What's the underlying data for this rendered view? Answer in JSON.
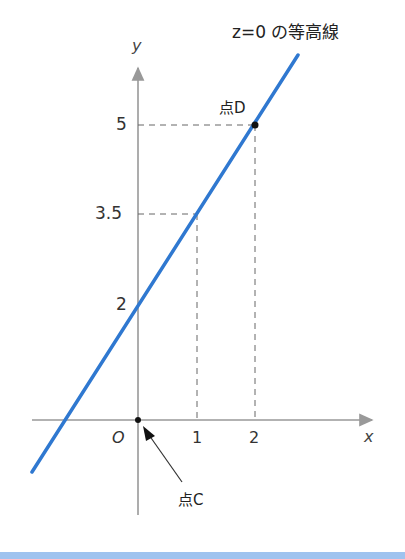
{
  "title": "z=0 の等高線",
  "axes": {
    "x_label": "x",
    "y_label": "y",
    "origin_label": "O",
    "x_ticks": [
      "1",
      "2"
    ],
    "y_ticks": [
      "2",
      "3.5",
      "5"
    ]
  },
  "points": {
    "C": {
      "label": "点C",
      "x": 0,
      "y": 0
    },
    "D": {
      "label": "点D",
      "x": 2,
      "y": 5
    }
  },
  "line": {
    "description": "z=0 contour",
    "slope": 1.5,
    "intercept": 2,
    "color": "#2f78d0"
  },
  "guides": [
    {
      "x": 1,
      "y": 3.5
    },
    {
      "x": 2,
      "y": 5
    }
  ],
  "colors": {
    "line": "#2f78d0",
    "axis": "#888888",
    "guide": "#666666",
    "band": "#9fc3ef"
  }
}
